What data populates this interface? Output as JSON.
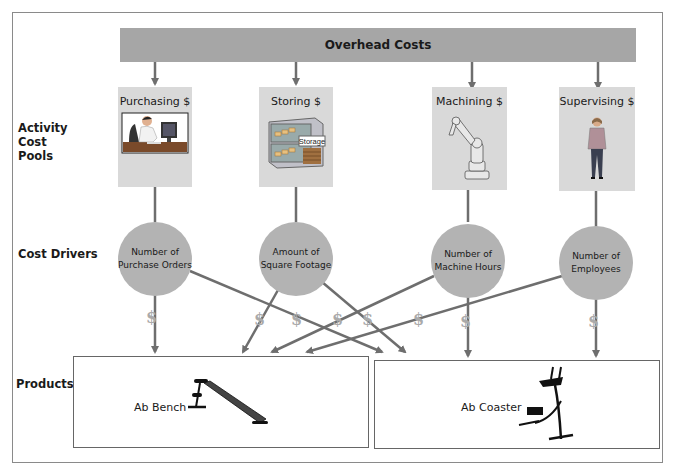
{
  "diagram": {
    "overhead": {
      "label": "Overhead Costs"
    },
    "row_labels": {
      "activity_cost_pools": [
        "Activity",
        "Cost",
        "Pools"
      ],
      "cost_drivers": "Cost Drivers",
      "products": "Products"
    },
    "activity_cost_pools": [
      {
        "label": "Purchasing $",
        "icon": "office-worker-computer-icon"
      },
      {
        "label": "Storing $",
        "icon": "storage-warehouse-icon",
        "icon_text": "Storage"
      },
      {
        "label": "Machining $",
        "icon": "robot-arm-icon"
      },
      {
        "label": "Supervising $",
        "icon": "supervisor-person-icon"
      }
    ],
    "cost_drivers": [
      {
        "line1": "Number of",
        "line2": "Purchase Orders"
      },
      {
        "line1": "Amount of",
        "line2": "Square Footage"
      },
      {
        "line1": "Number of",
        "line2": "Machine Hours"
      },
      {
        "line1": "Number of",
        "line2": "Employees"
      }
    ],
    "products": [
      {
        "label": "Ab Bench",
        "icon": "ab-bench-icon"
      },
      {
        "label": "Ab Coaster",
        "icon": "ab-coaster-icon"
      }
    ],
    "dollar_symbol": "$",
    "colors": {
      "overhead_bar": "#a6a6a6",
      "pool_box": "#d9d9d9",
      "driver_circle": "#b3b3b3",
      "arrow": "#6e6e6e"
    }
  }
}
